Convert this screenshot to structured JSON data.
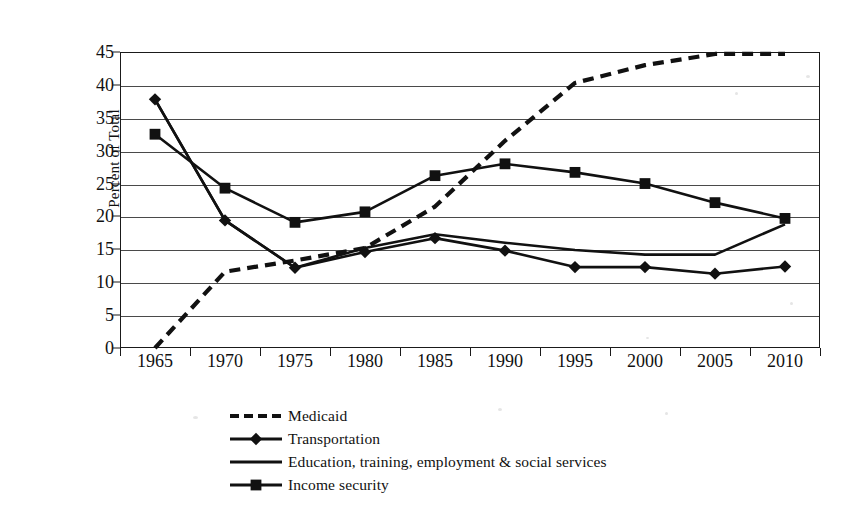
{
  "chart_data": {
    "type": "line",
    "title": "",
    "xlabel": "",
    "ylabel": "Percent of Total",
    "x": [
      1965,
      1970,
      1975,
      1980,
      1985,
      1990,
      1995,
      2000,
      2005,
      2010
    ],
    "categories": [
      "1965",
      "1970",
      "1975",
      "1980",
      "1985",
      "1990",
      "1995",
      "2000",
      "2005",
      "2010"
    ],
    "ylim": [
      0,
      45
    ],
    "ytick_labels": [
      "0",
      "5",
      "10",
      "15",
      "20",
      "25",
      "30",
      "35",
      "40",
      "45"
    ],
    "ytick_values": [
      0,
      5,
      10,
      15,
      20,
      25,
      30,
      35,
      40,
      45
    ],
    "grid": "horizontal",
    "legend_position": "bottom",
    "series": [
      {
        "name": "Medicaid",
        "style": "dashed",
        "marker": "none",
        "color": "#111111",
        "values": [
          0.0,
          11.6,
          13.3,
          15.2,
          21.5,
          31.5,
          40.3,
          43.0,
          44.7,
          44.7
        ]
      },
      {
        "name": "Transportation",
        "style": "solid",
        "marker": "diamond",
        "color": "#111111",
        "values": [
          37.8,
          19.4,
          12.2,
          14.6,
          16.7,
          14.8,
          12.3,
          12.3,
          11.3,
          12.4
        ]
      },
      {
        "name": "Education, training, employment & social services",
        "style": "solid",
        "marker": "none",
        "color": "#111111",
        "values": [
          37.8,
          19.4,
          12.2,
          15.2,
          17.3,
          16.0,
          14.9,
          14.2,
          14.2,
          18.8
        ]
      },
      {
        "name": "Income security",
        "style": "solid",
        "marker": "square",
        "color": "#111111",
        "values": [
          32.5,
          24.3,
          19.1,
          20.7,
          26.2,
          28.0,
          26.7,
          25.0,
          22.1,
          19.7
        ]
      }
    ]
  },
  "legend": {
    "items": [
      {
        "label": "Medicaid",
        "key": "dashed-line-key"
      },
      {
        "label": "Transportation",
        "key": "diamond-line-key"
      },
      {
        "label": "Education, training, employment & social services",
        "key": "solid-line-key"
      },
      {
        "label": "Income security",
        "key": "square-line-key"
      }
    ]
  },
  "axes": {
    "y_title": "Percent of Total"
  }
}
